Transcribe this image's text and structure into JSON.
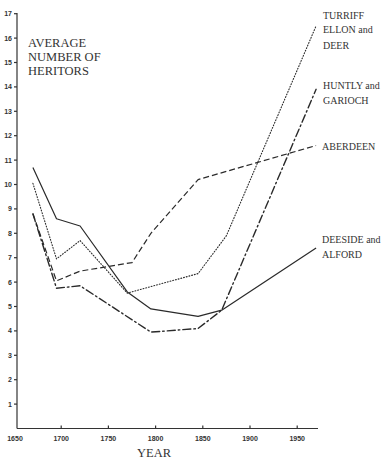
{
  "chart_data": {
    "type": "line",
    "title": "AVERAGE NUMBER OF HERITORS",
    "title_lines": [
      "AVERAGE",
      "NUMBER OF",
      "HERITORS"
    ],
    "xlabel": "YEAR",
    "ylabel": "AVERAGE NUMBER OF HERITORS",
    "xlim": [
      1650,
      1970
    ],
    "ylim": [
      0,
      17
    ],
    "x_ticks": [
      1650,
      1700,
      1750,
      1800,
      1850,
      1900,
      1950
    ],
    "y_ticks": [
      1,
      2,
      3,
      4,
      5,
      6,
      7,
      8,
      9,
      10,
      11,
      12,
      13,
      14,
      15,
      16,
      17
    ],
    "grid": false,
    "legend": "direct labels at right end of each line",
    "series": [
      {
        "name": "TURRIFF ELLON and DEER",
        "label_lines": [
          "TURRIFF",
          "ELLON and",
          "DEER"
        ],
        "style": "dotted",
        "x": [
          1670,
          1695,
          1720,
          1770,
          1845,
          1875,
          1970
        ],
        "values": [
          10.05,
          6.95,
          7.7,
          5.55,
          6.35,
          7.9,
          16.5
        ]
      },
      {
        "name": "HUNTLY and GARIOCH",
        "label_lines": [
          "HUNTLY and",
          "GARIOCH"
        ],
        "style": "dash-dot",
        "x": [
          1670,
          1695,
          1720,
          1795,
          1845,
          1870,
          1970
        ],
        "values": [
          8.8,
          5.75,
          5.85,
          3.95,
          4.1,
          4.85,
          13.9
        ]
      },
      {
        "name": "ABERDEEN",
        "label_lines": [
          "ABERDEEN"
        ],
        "style": "dashed",
        "x": [
          1670,
          1695,
          1720,
          1775,
          1795,
          1845,
          1970
        ],
        "values": [
          8.8,
          6.05,
          6.45,
          6.8,
          8.0,
          10.2,
          11.6
        ]
      },
      {
        "name": "DEESIDE and ALFORD",
        "label_lines": [
          "DEESIDE and",
          "ALFORD"
        ],
        "style": "solid",
        "x": [
          1670,
          1695,
          1720,
          1770,
          1795,
          1845,
          1870,
          1970
        ],
        "values": [
          10.7,
          8.6,
          8.3,
          5.6,
          4.9,
          4.6,
          4.85,
          7.4
        ]
      }
    ]
  },
  "labels": {
    "title_line1": "AVERAGE",
    "title_line2": "NUMBER OF",
    "title_line3": "HERITORS",
    "xlabel": "YEAR",
    "turriff_1": "TURRIFF",
    "turriff_2": "ELLON and",
    "turriff_3": "DEER",
    "huntly_1": "HUNTLY and",
    "huntly_2": "GARIOCH",
    "aberdeen": "ABERDEEN",
    "deeside_1": "DEESIDE and",
    "deeside_2": "ALFORD"
  }
}
